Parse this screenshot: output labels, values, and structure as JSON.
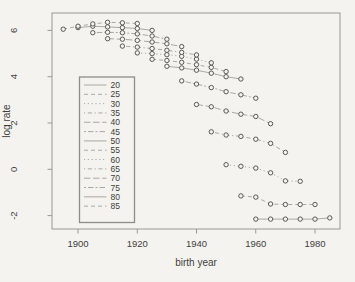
{
  "figure": {
    "kind": "R base-graphics line plot, grayscale scan",
    "xlabel": "birth year",
    "ylabel": "log rate"
  },
  "colors": {
    "background": "#f4f3f0",
    "plot_border": "#9a9894",
    "axis_text": "#3f3e3c",
    "series_line": "#aaa8a4",
    "marker_stroke": "#53514e",
    "legend_border": "#8f8d89"
  },
  "chart_data": {
    "type": "line",
    "title": "",
    "xlabel": "birth year",
    "ylabel": "log rate",
    "x_ticks": [
      1900,
      1920,
      1940,
      1960,
      1980
    ],
    "y_ticks": [
      -2,
      0,
      2,
      4,
      6
    ],
    "xlim": [
      1891,
      1989
    ],
    "ylim": [
      -2.8,
      6.8
    ],
    "grid": false,
    "marker": "open-circle",
    "legend_position": "left-middle-box",
    "legend_entries": [
      "20",
      "25",
      "30",
      "35",
      "40",
      "45",
      "50",
      "55",
      "60",
      "65",
      "70",
      "75",
      "80",
      "85"
    ],
    "series": [
      {
        "name": "20",
        "line_type": "solid",
        "x": [
          1960,
          1965,
          1970,
          1975,
          1980,
          1985
        ],
        "y": [
          -2.15,
          -2.15,
          -2.15,
          -2.15,
          -2.15,
          -2.1
        ]
      },
      {
        "name": "25",
        "line_type": "dashed",
        "x": [
          1955,
          1960,
          1965,
          1970,
          1975,
          1980
        ],
        "y": [
          -1.15,
          -1.2,
          -1.5,
          -1.52,
          -1.52,
          -1.52
        ]
      },
      {
        "name": "30",
        "line_type": "dotted",
        "x": [
          1950,
          1955,
          1960,
          1965,
          1970,
          1975
        ],
        "y": [
          0.2,
          0.13,
          0.05,
          -0.15,
          -0.5,
          -0.52
        ]
      },
      {
        "name": "35",
        "line_type": "dotdash",
        "x": [
          1945,
          1950,
          1955,
          1960,
          1965,
          1970
        ],
        "y": [
          1.62,
          1.48,
          1.42,
          1.3,
          1.12,
          0.73
        ]
      },
      {
        "name": "40",
        "line_type": "longdash",
        "x": [
          1940,
          1945,
          1950,
          1955,
          1960,
          1965
        ],
        "y": [
          2.8,
          2.7,
          2.52,
          2.38,
          2.28,
          1.97
        ]
      },
      {
        "name": "45",
        "line_type": "twodash",
        "x": [
          1935,
          1940,
          1945,
          1950,
          1955,
          1960
        ],
        "y": [
          3.82,
          3.68,
          3.53,
          3.35,
          3.22,
          3.07
        ]
      },
      {
        "name": "50",
        "line_type": "solid",
        "x": [
          1930,
          1935,
          1940,
          1945,
          1950,
          1955
        ],
        "y": [
          4.45,
          4.38,
          4.28,
          4.15,
          4.0,
          3.9
        ]
      },
      {
        "name": "55",
        "line_type": "dashed",
        "x": [
          1925,
          1930,
          1935,
          1940,
          1945,
          1950
        ],
        "y": [
          4.75,
          4.7,
          4.62,
          4.52,
          4.4,
          4.22
        ]
      },
      {
        "name": "60",
        "line_type": "dotted",
        "x": [
          1920,
          1925,
          1930,
          1935,
          1940,
          1945
        ],
        "y": [
          5.03,
          5.0,
          4.95,
          4.88,
          4.76,
          4.6
        ]
      },
      {
        "name": "65",
        "line_type": "dotdash",
        "x": [
          1915,
          1920,
          1925,
          1930,
          1935,
          1940
        ],
        "y": [
          5.32,
          5.28,
          5.22,
          5.14,
          5.05,
          4.94
        ]
      },
      {
        "name": "70",
        "line_type": "longdash",
        "x": [
          1910,
          1915,
          1920,
          1925,
          1930,
          1935
        ],
        "y": [
          5.64,
          5.62,
          5.57,
          5.5,
          5.42,
          5.3
        ]
      },
      {
        "name": "75",
        "line_type": "twodash",
        "x": [
          1905,
          1910,
          1915,
          1920,
          1925,
          1930
        ],
        "y": [
          5.9,
          5.92,
          5.9,
          5.85,
          5.76,
          5.62
        ]
      },
      {
        "name": "80",
        "line_type": "solid",
        "x": [
          1900,
          1905,
          1910,
          1915,
          1920,
          1925
        ],
        "y": [
          6.12,
          6.18,
          6.15,
          6.12,
          6.08,
          6.0
        ]
      },
      {
        "name": "85",
        "line_type": "dashed",
        "x": [
          1895,
          1900,
          1905,
          1910,
          1915,
          1920
        ],
        "y": [
          6.05,
          6.18,
          6.28,
          6.35,
          6.33,
          6.3
        ]
      }
    ]
  }
}
